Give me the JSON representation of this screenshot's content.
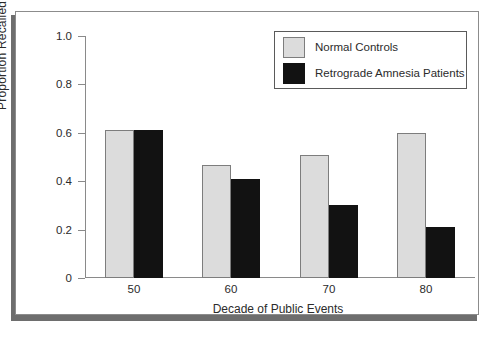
{
  "chart_data": {
    "type": "bar",
    "title": "",
    "xlabel": "Decade of Public Events",
    "ylabel": "Proportion Recalled",
    "categories": [
      "50",
      "60",
      "70",
      "80"
    ],
    "series": [
      {
        "name": "Normal Controls",
        "color": "#dcdcdc",
        "values": [
          0.61,
          0.465,
          0.51,
          0.6
        ]
      },
      {
        "name": "Retrograde Amnesia Patients",
        "color": "#121212",
        "values": [
          0.61,
          0.41,
          0.3,
          0.21
        ]
      }
    ],
    "ylim": [
      0,
      1.0
    ],
    "ytick_labels": [
      "0",
      "0.2",
      "0.4",
      "0.6",
      "0.8",
      "1.0"
    ],
    "ytick_values": [
      0,
      0.2,
      0.4,
      0.6,
      0.8,
      1.0
    ],
    "xtick_labels": [
      "50",
      "60",
      "70",
      "80"
    ],
    "grid": false,
    "legend_position": "top-right"
  },
  "legend": {
    "entries": [
      {
        "label": "Normal Controls",
        "swatch": "light-gray-swatch"
      },
      {
        "label": "Retrograde Amnesia Patients",
        "swatch": "black-swatch"
      }
    ]
  },
  "axes": {
    "y_title": "Proportion Recalled",
    "x_title": "Decade of Public Events"
  },
  "colors": {
    "normal_controls": "#dcdcdc",
    "amnesia_patients": "#121212",
    "axis": "#8a8a8a",
    "frame_border": "#8c8c8c",
    "frame_shadow": "#6e6e6e",
    "text": "#2b2b2b"
  }
}
